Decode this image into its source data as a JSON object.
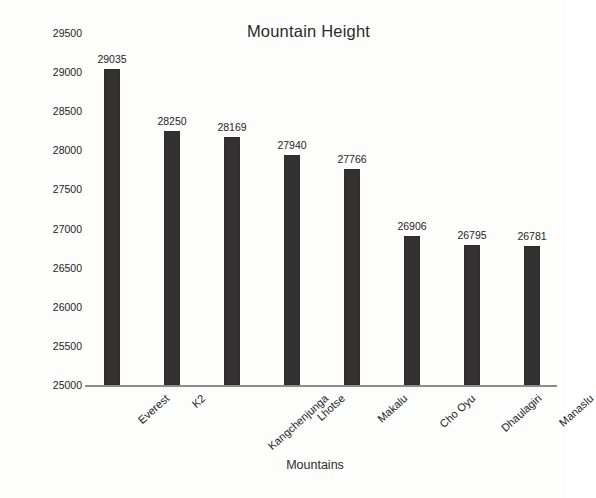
{
  "chart_data": {
    "type": "bar",
    "title": "Mountain Height",
    "xlabel": "Mountains",
    "ylabel": "Height in feet",
    "categories": [
      "Everest",
      "K2",
      "Kangchenjunga",
      "Lhotse",
      "Makalu",
      "Cho Oyu",
      "Dhaulagiri",
      "Manaslu"
    ],
    "values": [
      29035,
      28250,
      28169,
      27940,
      27766,
      26906,
      26795,
      26781
    ],
    "value_labels": [
      "29035",
      "28250",
      "28169",
      "27940",
      "27766",
      "26906",
      "26795",
      "26781"
    ],
    "ylim": [
      25000,
      29500
    ],
    "ytick_step": 500,
    "ytick_labels": [
      "29500",
      "29000",
      "28500",
      "28000",
      "27500",
      "27000",
      "26500",
      "26000",
      "25500",
      "25000"
    ],
    "ytick_values": [
      29500,
      29000,
      28500,
      28000,
      27500,
      27000,
      26500,
      26000,
      25500,
      25000
    ],
    "grid": false,
    "legend": false,
    "bar_color": "#333132",
    "axis_color": "#8c8c8c",
    "background_color": "#fdfdfc",
    "text_color": "#232323"
  }
}
